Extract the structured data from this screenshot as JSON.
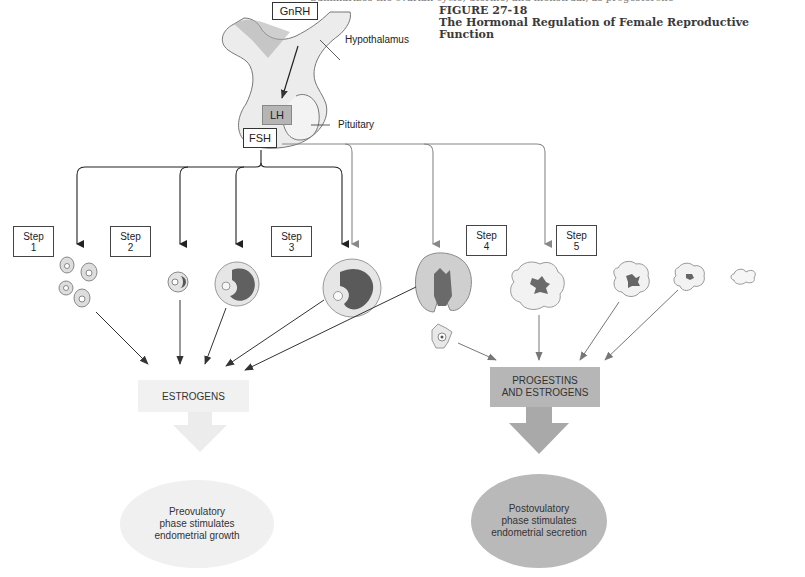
{
  "running_header": "Summarizes the ovarian cycle, uterine, and menstrual, as progesterone",
  "figure": {
    "number": "FIGURE 27-18",
    "caption": "The Hormonal Regulation of Female Reproductive Function"
  },
  "brain": {
    "gnrh": "GnRH",
    "hypothalamus_label": "Hypothalamus",
    "lh": "LH",
    "fsh": "FSH",
    "pituitary_label": "Pituitary"
  },
  "steps": [
    {
      "line1": "Step",
      "line2": "1"
    },
    {
      "line1": "Step",
      "line2": "2"
    },
    {
      "line1": "Step",
      "line2": "3"
    },
    {
      "line1": "Step",
      "line2": "4"
    },
    {
      "line1": "Step",
      "line2": "5"
    }
  ],
  "hormones": {
    "estrogens": "ESTROGENS",
    "progestins_line1": "PROGESTINS",
    "progestins_line2": "AND ESTROGENS"
  },
  "outcomes": {
    "pre_line1": "Preovulatory",
    "pre_line2": "phase stimulates",
    "pre_line3": "endometrial growth",
    "post_line1": "Postovulatory",
    "post_line2": "phase stimulates",
    "post_line3": "endometrial secretion"
  },
  "colors": {
    "fsh_arrow": "#333333",
    "lh_arrow": "#888888",
    "estrogens_bg": "#f1f1f1",
    "progestins_bg": "#b6b6b6",
    "pre_oval": "#f0f0f0",
    "post_oval": "#b9b9b9"
  }
}
